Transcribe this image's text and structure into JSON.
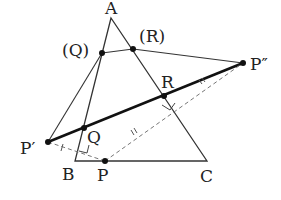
{
  "diagram": {
    "type": "geometry",
    "colors": {
      "line": "#333333",
      "dashed": "#777777",
      "point": "#111111"
    },
    "points": {
      "A": {
        "label": "A",
        "x": 111,
        "y": 18
      },
      "B": {
        "label": "B",
        "x": 75,
        "y": 161
      },
      "C": {
        "label": "C",
        "x": 207,
        "y": 161
      },
      "P": {
        "label": "P",
        "x": 105,
        "y": 161
      },
      "P1": {
        "label": "P′",
        "x": 48,
        "y": 142
      },
      "P2": {
        "label": "P″",
        "x": 243,
        "y": 63
      },
      "Q": {
        "label": "Q",
        "x": 84,
        "y": 128
      },
      "R": {
        "label": "R",
        "x": 164,
        "y": 96
      },
      "Qalt": {
        "label": "(Q)",
        "x": 102,
        "y": 53
      },
      "Ralt": {
        "label": "(R)",
        "x": 133,
        "y": 49
      }
    },
    "marks": {
      "single_tick": "|",
      "double_tick": "||"
    }
  }
}
